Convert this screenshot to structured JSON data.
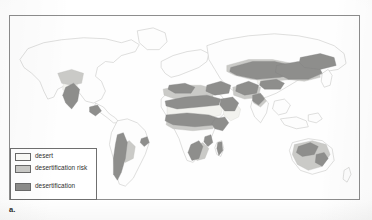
{
  "figure": {
    "caption": "a.",
    "kind": "world-map"
  },
  "legend": {
    "items": [
      {
        "label": "desert",
        "color": "#fbfbf8",
        "swatch_name": "legend-swatch-desert"
      },
      {
        "label": "desertification risk",
        "color": "#c9c9c6",
        "swatch_name": "legend-swatch-desertification-risk"
      },
      {
        "label": "desertification",
        "color": "#8d8d8b",
        "swatch_name": "legend-swatch-desertification"
      }
    ]
  },
  "map": {
    "frame_color": "#8d8d8d",
    "ocean_color": "#fefefe",
    "coastline_color": "#c2c2c0",
    "colors": {
      "desert": "#f4f4f0",
      "risk": "#c9c9c6",
      "desertification": "#8d8d8b",
      "land_outline": "#c2c2c0"
    },
    "regions": [
      {
        "name": "North America — Great Basin / Sonoran",
        "class": "desert"
      },
      {
        "name": "North America — Great Plains margin",
        "class": "risk"
      },
      {
        "name": "Mexico — Baja / Chihuahua",
        "class": "desertification"
      },
      {
        "name": "South America — Atacama / Patagonia",
        "class": "desertification"
      },
      {
        "name": "South America — Caatinga",
        "class": "desertification"
      },
      {
        "name": "North Africa — Sahara",
        "class": "desert"
      },
      {
        "name": "Africa — Sahel",
        "class": "desertification"
      },
      {
        "name": "Africa — Horn / East Africa",
        "class": "desertification"
      },
      {
        "name": "Southern Africa — Kalahari / Namib",
        "class": "desertification"
      },
      {
        "name": "Arabian Peninsula",
        "class": "desert"
      },
      {
        "name": "Middle East / Iran",
        "class": "risk"
      },
      {
        "name": "Central Asia — Kazakhstan / Aral",
        "class": "desertification"
      },
      {
        "name": "Asia — Gobi / Taklamakan",
        "class": "desertification"
      },
      {
        "name": "South Asia — Thar",
        "class": "desertification"
      },
      {
        "name": "Mediterranean margin",
        "class": "risk"
      },
      {
        "name": "Australia — interior",
        "class": "risk"
      },
      {
        "name": "Australia — arid belts",
        "class": "desertification"
      }
    ]
  }
}
